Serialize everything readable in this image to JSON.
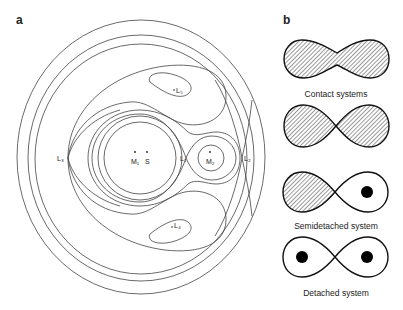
{
  "panel_a": {
    "label": "a",
    "points": {
      "M1": "M₁",
      "S": "S",
      "M2": "M₂",
      "L1": "L₁",
      "L2": "L₂",
      "L3": "L₃",
      "L4": "L₄",
      "L5": "L₅"
    }
  },
  "panel_b": {
    "label": "b",
    "captions": {
      "contact": "Contact systems",
      "semidetached": "Semidetached system",
      "detached": "Detached system"
    }
  },
  "colors": {
    "line": "#444444",
    "lobe_outline": "#111111",
    "hatch": "#333333",
    "star": "#000000"
  }
}
